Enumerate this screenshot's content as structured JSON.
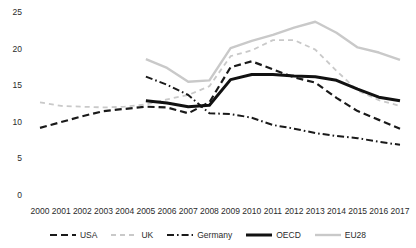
{
  "chart_data": {
    "type": "line",
    "title": "",
    "xlabel": "",
    "ylabel": "",
    "ylim": [
      0,
      25
    ],
    "yticks": [
      0,
      5,
      10,
      15,
      20,
      25
    ],
    "grid": false,
    "legend_position": "bottom",
    "categories": [
      "2000",
      "2001",
      "2002",
      "2003",
      "2004",
      "2005",
      "2006",
      "2007",
      "2008",
      "2009",
      "2010",
      "2011",
      "2012",
      "2013",
      "2014",
      "2015",
      "2016",
      "2017"
    ],
    "series": [
      {
        "name": "USA",
        "style": "dashed",
        "color": "#1a1a1a",
        "width": 2.2,
        "values": [
          9.3,
          10.1,
          10.9,
          11.6,
          11.9,
          12.2,
          12.1,
          11.3,
          12.8,
          17.6,
          18.4,
          17.3,
          16.2,
          15.5,
          13.4,
          11.6,
          10.4,
          9.2
        ]
      },
      {
        "name": "UK",
        "style": "dashed",
        "color": "#c9c9c9",
        "width": 1.8,
        "values": [
          12.8,
          12.3,
          12.2,
          12.1,
          12.2,
          12.5,
          13.2,
          13.8,
          15.0,
          19.1,
          19.9,
          21.3,
          21.3,
          20.0,
          17.1,
          14.4,
          13.1,
          12.3
        ]
      },
      {
        "name": "Germany",
        "style": "dashdot",
        "color": "#1a1a1a",
        "width": 2.0,
        "values": [
          null,
          null,
          null,
          null,
          null,
          16.3,
          15.2,
          13.8,
          11.3,
          11.2,
          10.7,
          9.7,
          9.2,
          8.6,
          8.2,
          7.9,
          7.4,
          7.0
        ]
      },
      {
        "name": "OECD",
        "style": "solid",
        "color": "#111111",
        "width": 3.0,
        "values": [
          null,
          null,
          null,
          null,
          null,
          13.0,
          12.7,
          12.2,
          12.4,
          15.9,
          16.6,
          16.6,
          16.4,
          16.3,
          15.8,
          14.6,
          13.5,
          13.0
        ]
      },
      {
        "name": "EU28",
        "style": "solid",
        "color": "#c9c9c9",
        "width": 2.4,
        "values": [
          null,
          null,
          null,
          null,
          null,
          18.7,
          17.5,
          15.6,
          15.8,
          20.2,
          21.2,
          22.0,
          23.0,
          23.8,
          22.3,
          20.3,
          19.6,
          18.6
        ]
      }
    ]
  },
  "legend": {
    "items": [
      {
        "label": "USA"
      },
      {
        "label": "UK"
      },
      {
        "label": "Germany"
      },
      {
        "label": "OECD"
      },
      {
        "label": "EU28"
      }
    ]
  }
}
